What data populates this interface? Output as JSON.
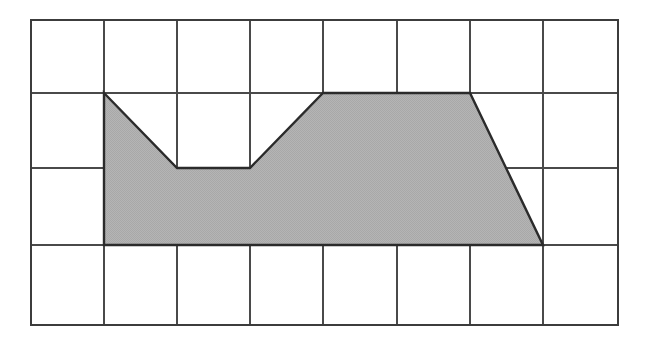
{
  "figure": {
    "background_color": "#ffffff",
    "grid": {
      "columns": 8,
      "rows": 4,
      "line_color": "#4a4a4a",
      "border_color": "#3c3c3c",
      "x_lines": [
        31,
        104,
        177,
        250,
        323,
        397,
        470,
        543,
        618
      ],
      "y_lines": [
        20,
        93,
        168,
        245,
        325
      ],
      "cell_width": 73.4,
      "cell_height": 75.5
    },
    "shape": {
      "name": "shaded-polygon",
      "fill_color": "#b3b3b3",
      "fill_pattern": "dither-gray",
      "outline_color": "#2b2b2b",
      "outline_width": 2.4,
      "vertices_px": [
        [
          104,
          93
        ],
        [
          177,
          168
        ],
        [
          250,
          168
        ],
        [
          323,
          93
        ],
        [
          470,
          93
        ],
        [
          543,
          245
        ],
        [
          104,
          245
        ]
      ],
      "vertices_grid": [
        [
          1,
          1
        ],
        [
          2,
          2
        ],
        [
          3,
          2
        ],
        [
          4,
          1
        ],
        [
          6,
          1
        ],
        [
          7,
          3
        ],
        [
          1,
          3
        ]
      ],
      "area_grid_squares": 12
    }
  },
  "chart_data": {
    "type": "area",
    "xlabel": "",
    "ylabel": "",
    "grid": true,
    "xlim": [
      0,
      8
    ],
    "ylim": [
      0,
      4
    ],
    "categories": [
      "0",
      "1",
      "2",
      "3",
      "4",
      "5",
      "6",
      "7",
      "8"
    ],
    "series": [
      {
        "name": "shape-upper-boundary",
        "x": [
          1,
          2,
          3,
          4,
          6,
          7
        ],
        "values": [
          3,
          2,
          2,
          3,
          3,
          1
        ]
      },
      {
        "name": "shape-baseline",
        "x": [
          1,
          7
        ],
        "values": [
          1,
          1
        ]
      }
    ],
    "annotations": []
  }
}
